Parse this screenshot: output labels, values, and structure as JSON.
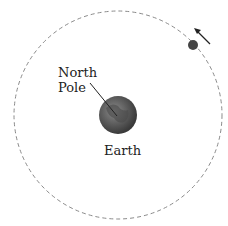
{
  "diagram": {
    "labels": {
      "north_pole_line1": "North",
      "north_pole_line2": "Pole",
      "earth": "Earth"
    },
    "colors": {
      "orbit": "#8a8a8a",
      "earth": "#5a5a5a",
      "moon": "#444444",
      "arrow": "#222222"
    }
  }
}
